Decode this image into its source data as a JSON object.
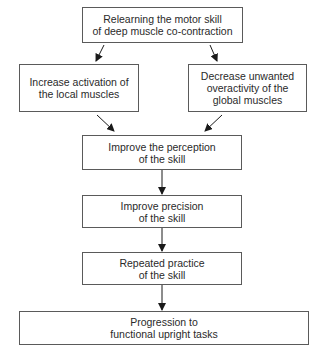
{
  "diagram": {
    "type": "flowchart",
    "nodes": [
      {
        "id": "n1",
        "lines": [
          "Relearning the motor skill",
          "of deep muscle co-contraction"
        ]
      },
      {
        "id": "n2",
        "lines": [
          "Increase activation of",
          "the local muscles"
        ]
      },
      {
        "id": "n3",
        "lines": [
          "Decrease unwanted",
          "overactivity of the",
          "global muscles"
        ]
      },
      {
        "id": "n4",
        "lines": [
          "Improve the perception",
          "of the skill"
        ]
      },
      {
        "id": "n5",
        "lines": [
          "Improve precision",
          "of the skill"
        ]
      },
      {
        "id": "n6",
        "lines": [
          "Repeated practice",
          "of the skill"
        ]
      },
      {
        "id": "n7",
        "lines": [
          "Progression to",
          "functional upright tasks"
        ]
      }
    ],
    "edges": [
      {
        "from": "n1",
        "to": "n2"
      },
      {
        "from": "n1",
        "to": "n3"
      },
      {
        "from": "n2",
        "to": "n4"
      },
      {
        "from": "n3",
        "to": "n4"
      },
      {
        "from": "n4",
        "to": "n5"
      },
      {
        "from": "n5",
        "to": "n6"
      },
      {
        "from": "n6",
        "to": "n7"
      }
    ],
    "colors": {
      "line": "#1a1a1a",
      "border": "#5a5a5a",
      "text": "#2a2a2a"
    }
  }
}
